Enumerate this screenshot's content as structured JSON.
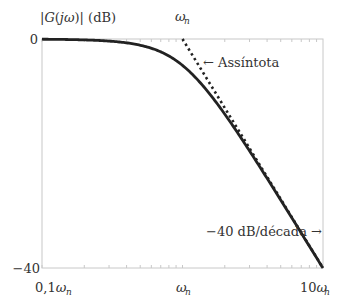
{
  "chart_data": {
    "type": "line",
    "title": "",
    "ylabel": "|G(jω)| (dB)",
    "xlabel": "",
    "xscale": "log",
    "xlim": [
      0.1,
      10
    ],
    "ylim": [
      -40,
      0
    ],
    "x_ticks": [
      {
        "value": 0.1,
        "label": "0,1ω",
        "sub": "n"
      },
      {
        "value": 1,
        "label": "ω",
        "sub": "n"
      },
      {
        "value": 10,
        "label": "10ω",
        "sub": "n"
      }
    ],
    "y_ticks": [
      {
        "value": 0,
        "label": "0"
      },
      {
        "value": -40,
        "label": "−40"
      }
    ],
    "top_label": {
      "value": 1,
      "label": "ω",
      "sub": "n"
    },
    "grid": false,
    "series": [
      {
        "name": "Resposta em magnitude",
        "style": "solid",
        "model": "second-order",
        "damping_ratio": 0.85,
        "x": [
          0.1,
          0.2,
          0.3,
          0.5,
          0.7,
          1.0,
          1.5,
          2.0,
          3.0,
          5.0,
          7.0,
          10.0
        ],
        "y": [
          -0.04,
          -0.2,
          -0.5,
          -1.3,
          -2.5,
          -4.6,
          -8.0,
          -11.0,
          -16.8,
          -25.3,
          -31.1,
          -37.3
        ]
      },
      {
        "name": "Assíntota",
        "style": "dotted",
        "x": [
          1,
          10
        ],
        "y": [
          0,
          -40
        ]
      }
    ],
    "annotations": [
      {
        "text": "← Assíntota",
        "target": "asymptote"
      },
      {
        "text": "−40 dB/década →",
        "target": "slope"
      }
    ]
  }
}
